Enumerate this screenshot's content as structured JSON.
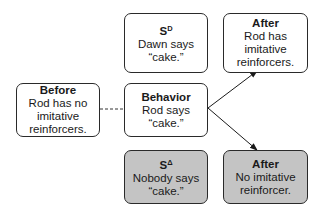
{
  "diagram": {
    "before": {
      "title": "Before",
      "lines": [
        "Rod has no",
        "imitative",
        "reinforcers."
      ]
    },
    "behavior": {
      "title": "Behavior",
      "lines": [
        "Rod says",
        "“cake.”"
      ]
    },
    "sd": {
      "title_main": "S",
      "title_sup": "D",
      "lines": [
        "Dawn says",
        "“cake.”"
      ]
    },
    "sdelta": {
      "title_main": "S",
      "title_sup": "Δ",
      "lines": [
        "Nobody says",
        "“cake.”"
      ]
    },
    "after_top": {
      "title": "After",
      "lines": [
        "Rod has",
        "imitative",
        "reinforcers."
      ]
    },
    "after_bottom": {
      "title": "After",
      "lines": [
        "No imitative",
        "reinforcer."
      ]
    },
    "colors": {
      "shaded_fill": "#c4c4c4",
      "border": "#2a2a2a"
    }
  }
}
